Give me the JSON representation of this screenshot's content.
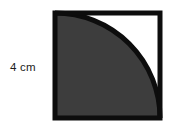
{
  "figure": {
    "label": "4 cm",
    "colors": {
      "outline": "#0d0d0d",
      "shaded_region": "#3d3d3d",
      "unshaded_region": "#ffffff",
      "background": "#ffffff",
      "label_text": "#1b1b1b"
    },
    "square": {
      "side_label": "4 cm",
      "x": 55,
      "y": 13,
      "size": 105,
      "stroke_width": 5
    },
    "arc": {
      "description": "quarter circle centered at top-right corner of square",
      "center_x": 160,
      "center_y": 13,
      "radius": 105,
      "start_x": 55,
      "start_y": 13,
      "end_x": 160,
      "end_y": 118,
      "stroke_width": 5
    }
  }
}
